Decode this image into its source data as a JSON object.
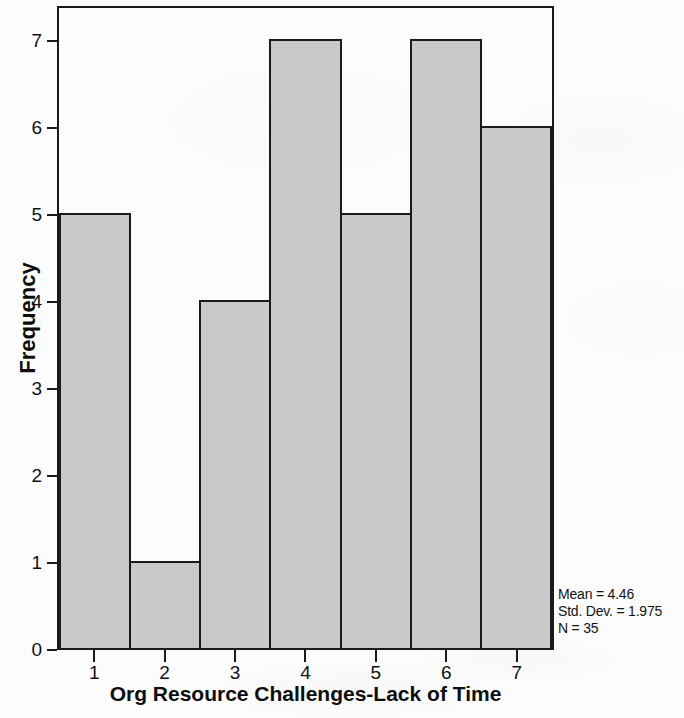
{
  "chart_data": {
    "type": "bar",
    "title": "",
    "subtitle": "",
    "xlabel": "Org Resource Challenges-Lack of Time",
    "ylabel": "Frequency",
    "categories": [
      "1",
      "2",
      "3",
      "4",
      "5",
      "6",
      "7"
    ],
    "values": [
      5,
      1,
      4,
      7,
      5,
      7,
      6
    ],
    "series": [
      {
        "name": "Frequency",
        "values": [
          5,
          1,
          4,
          7,
          5,
          7,
          6
        ]
      }
    ],
    "ylim": [
      0,
      7
    ],
    "xlim": [
      0.5,
      7.5
    ],
    "y_ticks": [
      "0",
      "1",
      "2",
      "3",
      "4",
      "5",
      "6",
      "7"
    ],
    "y_tick_values": [
      0,
      1,
      2,
      3,
      4,
      5,
      6,
      7
    ],
    "x_ticks": [
      "1",
      "2",
      "3",
      "4",
      "5",
      "6",
      "7"
    ],
    "grid": false,
    "legend": false,
    "legend_position": "none",
    "bar_fill_color": "#c9c9c9",
    "bar_border_color": "#1a1a1a",
    "axis_color": "#1a1a1a",
    "background_color": "#fcfcfc",
    "annotations": {
      "mean": "Mean = 4.46",
      "std_dev": "Std. Dev. = 1.975",
      "n": "N = 35"
    }
  },
  "axes": {
    "y_title": "Frequency",
    "x_title": "Org Resource Challenges-Lack of Time"
  },
  "stats": {
    "mean": "Mean = 4.46",
    "std_dev": "Std. Dev. = 1.975",
    "n": "N = 35"
  }
}
